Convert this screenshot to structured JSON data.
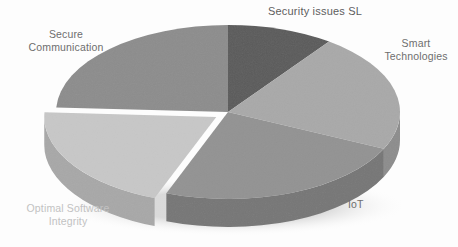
{
  "figure": {
    "width": 458,
    "height": 247,
    "background": "#fdfdfd"
  },
  "chart_data": {
    "type": "pie",
    "title": "Security issues SL",
    "subtitle": "",
    "xlabel": "",
    "ylabel": "",
    "legend_position": "none",
    "grid": false,
    "style": "3d-pie",
    "categories": [
      "Security issues SL",
      "Smart Technologies",
      "IoT",
      "Optimal Software Integrity",
      "Secure Communication"
    ],
    "values": [
      10,
      22,
      24,
      20,
      24
    ],
    "units": "percent",
    "colors": [
      "#5c5c5c",
      "#a9a9a9",
      "#939393",
      "#c7c7c7",
      "#8d8d8d"
    ],
    "side_colors": [
      "#3f3f3f",
      "#8d8d8d",
      "#777777",
      "#a8a8a8",
      "#737373"
    ],
    "exploded": [
      false,
      false,
      false,
      true,
      false
    ],
    "start_angle_deg": 0,
    "direction": "clockwise",
    "slices": [
      {
        "label": "Security issues SL",
        "value": 10,
        "color": "#5c5c5c",
        "side_color": "#3f3f3f",
        "start_deg": 0,
        "end_deg": 36,
        "exploded": false
      },
      {
        "label": "Smart Technologies",
        "value": 22,
        "color": "#a9a9a9",
        "side_color": "#8d8d8d",
        "start_deg": 36,
        "end_deg": 115,
        "exploded": false
      },
      {
        "label": "IoT",
        "value": 24,
        "color": "#939393",
        "side_color": "#777777",
        "start_deg": 115,
        "end_deg": 201,
        "exploded": false
      },
      {
        "label": "Optimal Software Integrity",
        "value": 20,
        "color": "#c7c7c7",
        "side_color": "#a8a8a8",
        "start_deg": 201,
        "end_deg": 273,
        "exploded": true
      },
      {
        "label": "Secure Communication",
        "value": 24,
        "color": "#8d8d8d",
        "side_color": "#737373",
        "start_deg": 273,
        "end_deg": 360,
        "exploded": false
      }
    ]
  },
  "labels": {
    "title": "Security issues SL",
    "smart_technologies": "Smart\nTechnologies",
    "iot": "IoT",
    "optimal_software_integrity": "Optimal Software\nIntegrity",
    "secure_communication": "Secure\nCommunication"
  },
  "geometry": {
    "center_x": 228,
    "center_y": 112,
    "radius_x": 172,
    "radius_y": 87,
    "depth": 28
  }
}
